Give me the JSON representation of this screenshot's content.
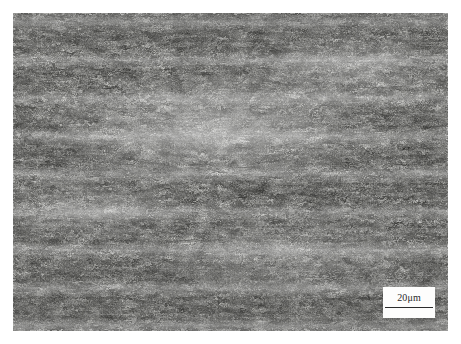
{
  "figure": {
    "kind": "optical-micrograph",
    "alt": "Grayscale optical micrograph of an etched steel specimen showing a fine acicular ferrite and bainitic lath microstructure with dark etched grain boundaries distributed on a light matrix, with faint horizontal banding along the rolling direction.",
    "plate": {
      "left": 13,
      "top": 13,
      "width": 435,
      "height": 318
    },
    "palette": {
      "background": "#ffffff",
      "matrix_light": "#f4f4f2",
      "matrix_mid": "#c9c9c6",
      "etched_dark": "#4a4a48",
      "label_color": "#2a2a2a",
      "scale_line_color": "#2b2b2b",
      "scale_patch": "#fdfdfc"
    }
  },
  "scale_bar": {
    "value": "20",
    "unit": "μm",
    "label": "20μm",
    "bar_length_px": 48,
    "position": "bottom-right"
  }
}
